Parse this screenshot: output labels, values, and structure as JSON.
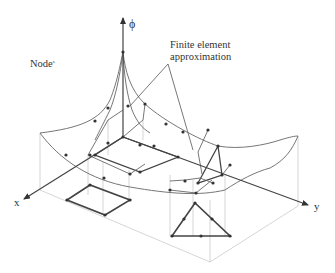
{
  "figure": {
    "labels": {
      "phi_axis": "ϕ",
      "x_axis": "x",
      "y_axis": "y",
      "node": "Node",
      "node_suffix": "s",
      "annotation_line1": "Finite element",
      "annotation_line2": "approximation"
    },
    "colors": {
      "background": "#ffffff",
      "lines": "#444444",
      "guides": "#bbbbbb",
      "text": "#333333"
    }
  }
}
